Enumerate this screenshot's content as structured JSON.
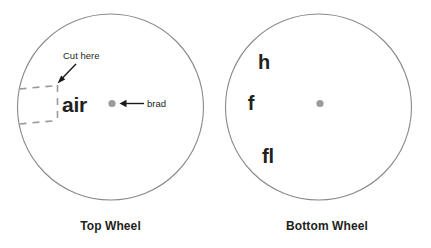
{
  "figure": {
    "background_color": "#ffffff",
    "outline_color": "#8a8a8a",
    "dash_color": "#9a9a9a",
    "brad_color": "#9b9b9b",
    "text_color": "#231f20"
  },
  "top_wheel": {
    "caption": "Top Wheel",
    "window_word": "air",
    "cut_label": "Cut here",
    "brad_label": "brad"
  },
  "bottom_wheel": {
    "caption": "Bottom Wheel",
    "letters": [
      {
        "text": "h"
      },
      {
        "text": "f"
      },
      {
        "text": "fl"
      }
    ]
  }
}
